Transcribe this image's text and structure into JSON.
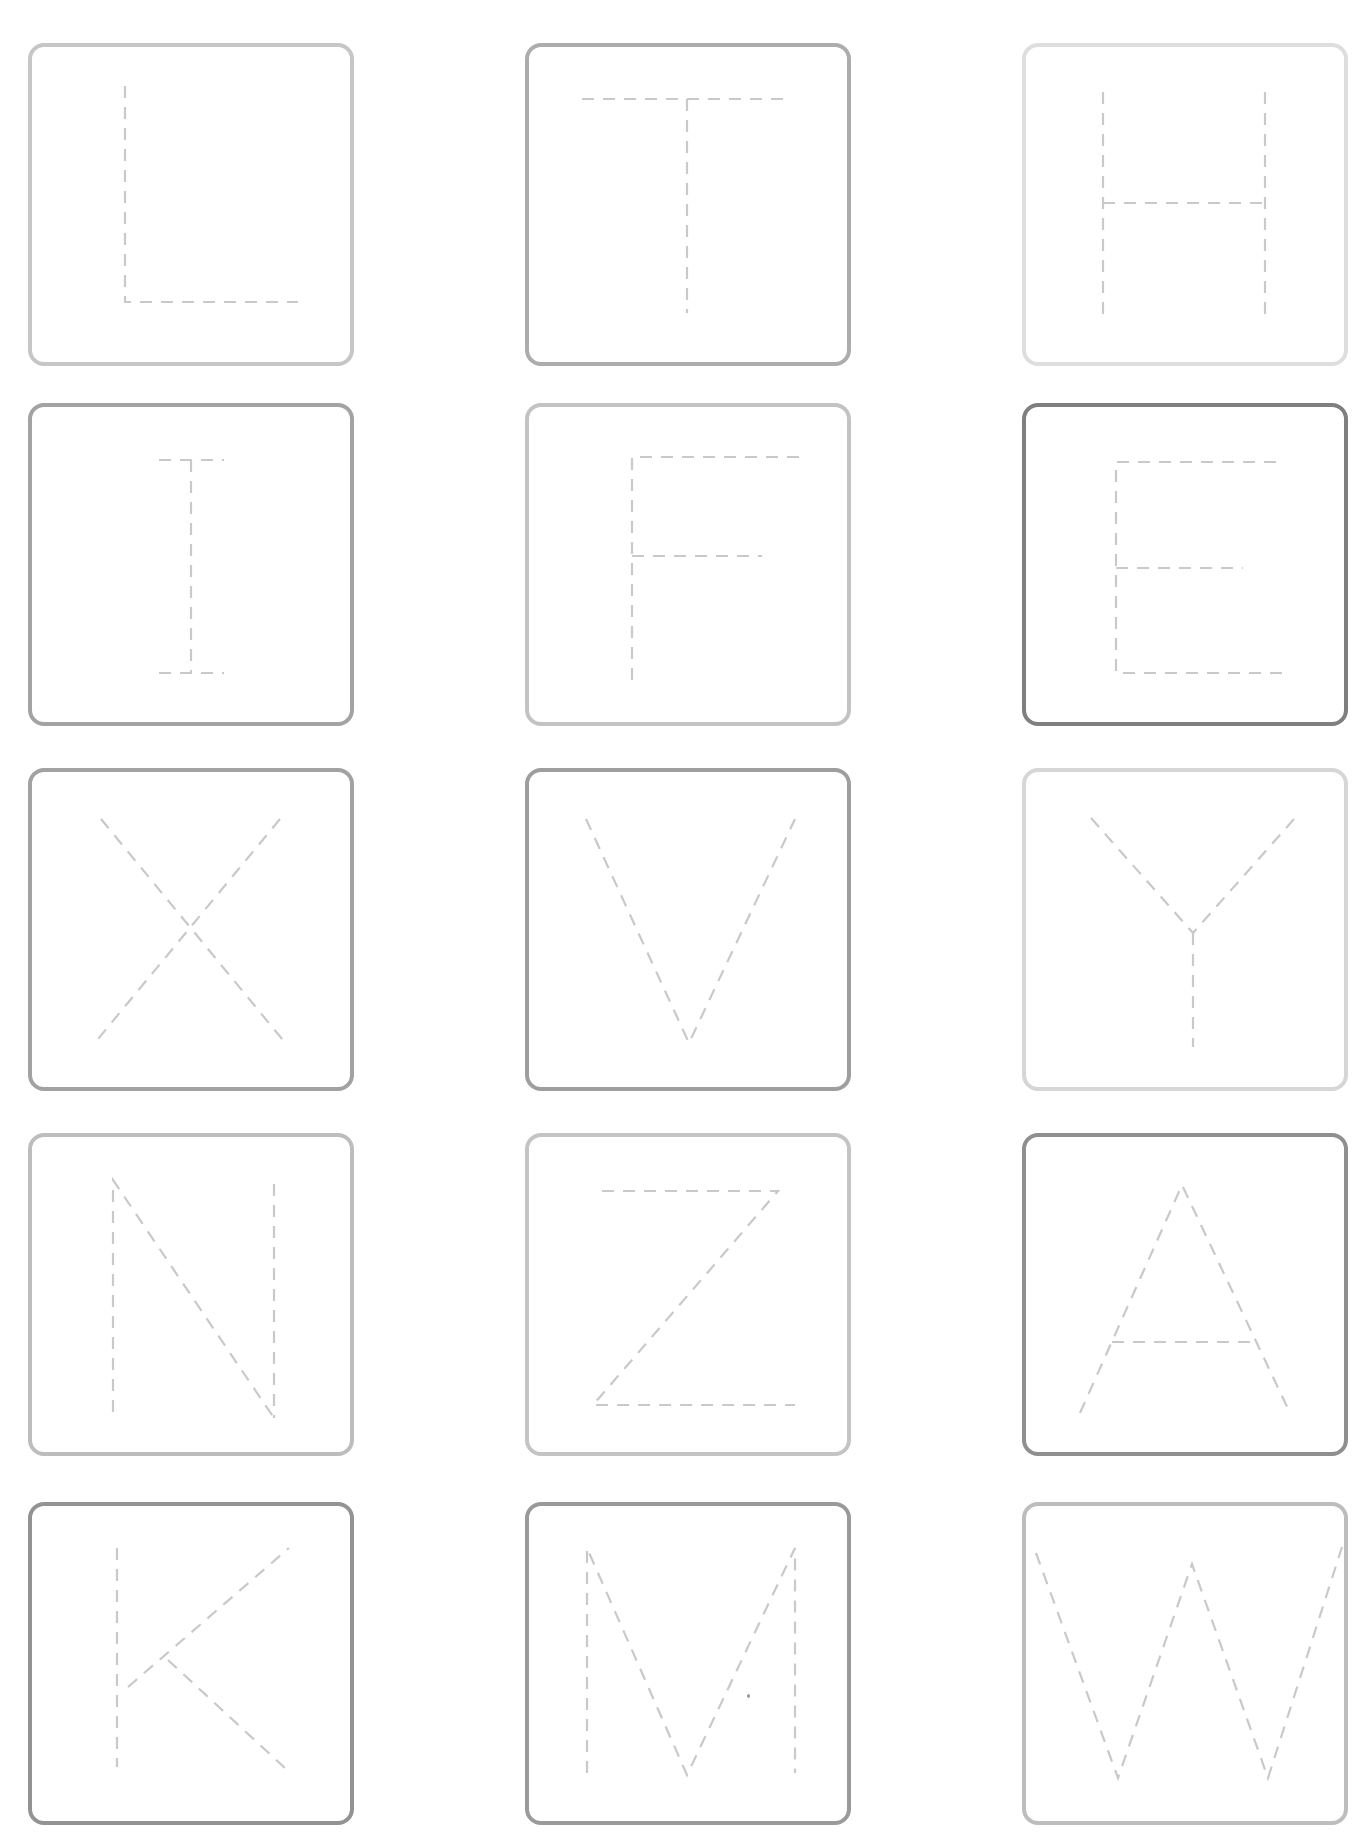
{
  "page": {
    "header_text": ""
  },
  "grid": {
    "columns_x": [
      28,
      525,
      1022
    ],
    "rows_y": [
      43,
      403,
      768,
      1133,
      1502
    ],
    "card_width": 326,
    "card_height": 323
  },
  "colors": {
    "background": "#ffffff",
    "dash_stroke": "#c9c9c9",
    "border_light": "#dcdcdc",
    "border_medium": "#bcbcbc",
    "border_dark": "#8a8a8a"
  },
  "cards": [
    {
      "letter": "L",
      "row": 0,
      "col": 0,
      "border": "#c6c6c6",
      "strokes": [
        [
          [
            97,
            43
          ],
          [
            97,
            259
          ],
          [
            270,
            259
          ]
        ]
      ]
    },
    {
      "letter": "T",
      "row": 0,
      "col": 1,
      "border": "#acacac",
      "strokes": [
        [
          [
            57,
            56
          ],
          [
            267,
            56
          ]
        ],
        [
          [
            162,
            56
          ],
          [
            162,
            270
          ]
        ]
      ]
    },
    {
      "letter": "H",
      "row": 0,
      "col": 2,
      "border": "#dedede",
      "strokes": [
        [
          [
            81,
            49
          ],
          [
            81,
            274
          ]
        ],
        [
          [
            243,
            49
          ],
          [
            243,
            274
          ]
        ],
        [
          [
            81,
            160
          ],
          [
            243,
            160
          ]
        ]
      ]
    },
    {
      "letter": "I",
      "row": 1,
      "col": 0,
      "border": "#a3a3a3",
      "strokes": [
        [
          [
            163,
            57
          ],
          [
            163,
            270
          ]
        ],
        [
          [
            131,
            57
          ],
          [
            196,
            57
          ]
        ],
        [
          [
            131,
            270
          ],
          [
            196,
            270
          ]
        ]
      ]
    },
    {
      "letter": "F",
      "row": 1,
      "col": 1,
      "border": "#c3c3c3",
      "strokes": [
        [
          [
            107,
            277
          ],
          [
            107,
            54
          ],
          [
            274,
            54
          ]
        ],
        [
          [
            107,
            153
          ],
          [
            237,
            153
          ]
        ]
      ]
    },
    {
      "letter": "E",
      "row": 1,
      "col": 2,
      "border": "#7f7f7f",
      "strokes": [
        [
          [
            254,
            59
          ],
          [
            94,
            59
          ],
          [
            94,
            270
          ],
          [
            260,
            270
          ]
        ],
        [
          [
            94,
            165
          ],
          [
            221,
            165
          ]
        ]
      ]
    },
    {
      "letter": "X",
      "row": 2,
      "col": 0,
      "border": "#a2a2a2",
      "strokes": [
        [
          [
            73,
            51
          ],
          [
            259,
            277
          ]
        ],
        [
          [
            252,
            51
          ],
          [
            65,
            277
          ]
        ]
      ]
    },
    {
      "letter": "V",
      "row": 2,
      "col": 1,
      "border": "#9e9e9e",
      "strokes": [
        [
          [
            61,
            51
          ],
          [
            164,
            275
          ],
          [
            270,
            51
          ]
        ]
      ]
    },
    {
      "letter": "Y",
      "row": 2,
      "col": 2,
      "border": "#d6d6d6",
      "strokes": [
        [
          [
            69,
            50
          ],
          [
            171,
            165
          ],
          [
            273,
            50
          ]
        ],
        [
          [
            171,
            165
          ],
          [
            171,
            279
          ]
        ]
      ]
    },
    {
      "letter": "N",
      "row": 3,
      "col": 0,
      "border": "#bdbdbd",
      "strokes": [
        [
          [
            85,
            279
          ],
          [
            85,
            47
          ],
          [
            246,
            285
          ]
        ],
        [
          [
            246,
            51
          ],
          [
            246,
            285
          ]
        ]
      ]
    },
    {
      "letter": "Z",
      "row": 3,
      "col": 1,
      "border": "#c4c4c4",
      "strokes": [
        [
          [
            77,
            58
          ],
          [
            253,
            58
          ],
          [
            68,
            272
          ],
          [
            270,
            272
          ]
        ]
      ]
    },
    {
      "letter": "A",
      "row": 3,
      "col": 2,
      "border": "#8f8f8f",
      "strokes": [
        [
          [
            58,
            280
          ],
          [
            160,
            52
          ],
          [
            268,
            280
          ]
        ],
        [
          [
            90,
            209
          ],
          [
            235,
            209
          ]
        ]
      ]
    },
    {
      "letter": "K",
      "row": 4,
      "col": 0,
      "border": "#939393",
      "strokes": [
        [
          [
            89,
            46
          ],
          [
            89,
            265
          ]
        ],
        [
          [
            100,
            185
          ],
          [
            261,
            46
          ]
        ],
        [
          [
            140,
            158
          ],
          [
            258,
            267
          ]
        ]
      ]
    },
    {
      "letter": "M",
      "row": 4,
      "col": 1,
      "border": "#9a9a9a",
      "strokes": [
        [
          [
            62,
            271
          ],
          [
            62,
            46
          ],
          [
            162,
            273
          ],
          [
            270,
            46
          ],
          [
            270,
            271
          ]
        ]
      ]
    },
    {
      "letter": "W",
      "row": 4,
      "col": 2,
      "border": "#bdbdbd",
      "strokes": [
        [
          [
            14,
            51
          ],
          [
            96,
            276
          ],
          [
            170,
            62
          ],
          [
            246,
            276
          ],
          [
            320,
            45
          ]
        ]
      ]
    }
  ],
  "artifacts": [
    {
      "name": "stray-dot",
      "x": 747,
      "y": 1694
    }
  ]
}
